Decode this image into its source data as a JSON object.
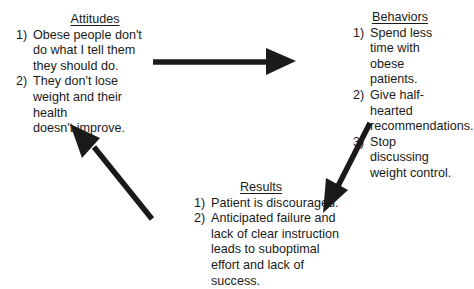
{
  "diagram": {
    "type": "cycle",
    "nodes": [
      {
        "id": "attitudes",
        "title": "Attitudes",
        "items": [
          {
            "num": "1)",
            "text_lines": [
              "Obese people don't",
              "do what I tell them",
              "they should do."
            ]
          },
          {
            "num": "2)",
            "text_lines": [
              "They don't lose",
              "weight and their health",
              "doesn't improve."
            ]
          }
        ]
      },
      {
        "id": "behaviors",
        "title": "Behaviors",
        "items": [
          {
            "num": "1)",
            "text_lines": [
              "Spend less time with",
              "obese patients."
            ]
          },
          {
            "num": "2)",
            "text_lines": [
              "Give half-hearted",
              "recommendations."
            ]
          },
          {
            "num": "3)",
            "text_lines": [
              "Stop discussing",
              "weight control."
            ]
          }
        ]
      },
      {
        "id": "results",
        "title": "Results",
        "items": [
          {
            "num": "1)",
            "text_lines": [
              "Patient is discouraged."
            ]
          },
          {
            "num": "2)",
            "text_lines": [
              "Anticipated failure and",
              "lack of clear instruction",
              "leads to suboptimal",
              "effort and lack of",
              "success."
            ]
          }
        ]
      }
    ],
    "edges": [
      {
        "from": "attitudes",
        "to": "behaviors",
        "direction": "right"
      },
      {
        "from": "behaviors",
        "to": "results",
        "direction": "down-left"
      },
      {
        "from": "results",
        "to": "attitudes",
        "direction": "up-left"
      }
    ],
    "arrow_color": "#1a1a1a",
    "text_color": "#1a1a1a"
  }
}
